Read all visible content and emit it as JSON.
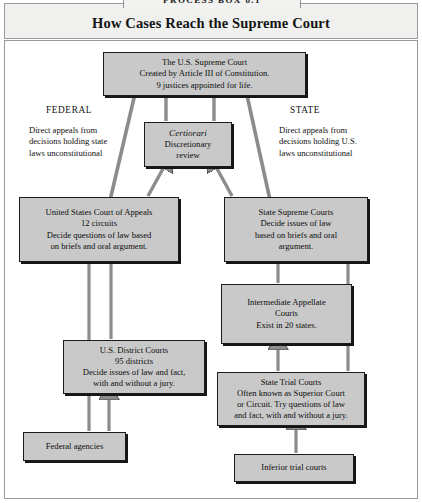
{
  "running_head": "PROCESS BOX 8.1",
  "header": {
    "title": "How Cases Reach the Supreme Court"
  },
  "labels": {
    "federal": "FEDERAL",
    "state": "STATE",
    "federal_note": "Direct appeals from\ndecisions holding state\nlaws unconstitutional",
    "state_note": "Direct appeals from\ndecisions holding U.S.\nlaws unconstitutional"
  },
  "nodes": {
    "supreme_court": {
      "name": "The U.S. Supreme Court",
      "text": "The U.S. Supreme Court\nCreated by Article III of Constitution.\n9 justices appointed for life."
    },
    "certiorari": {
      "title": "Certiorari",
      "text": "Discretionary\nreview"
    },
    "court_of_appeals": {
      "name": "United States Court of Appeals",
      "text": "United States Court of Appeals\n12 circuits\nDecide questions of law based\non briefs and oral argument."
    },
    "state_supreme_courts": {
      "name": "State Supreme Courts",
      "text": "State Supreme Courts\nDecide issues of law\nbased on briefs and oral\nargument."
    },
    "intermediate_appellate": {
      "name": "Intermediate Appellate Courts",
      "text": "Intermediate Appellate\nCourts\nExist in 20 states."
    },
    "district_courts": {
      "name": "U.S. District Courts",
      "text": "U.S. District Courts\n95 districts\nDecide issues of law and fact,\nwith and without a jury."
    },
    "state_trial_courts": {
      "name": "State Trial Courts",
      "text": "State Trial Courts\nOften known as Superior Court\nor Circuit. Try questions of law\nand fact, with and without a jury."
    },
    "federal_agencies": {
      "name": "Federal agencies",
      "text": "Federal agencies"
    },
    "inferior_trial_courts": {
      "name": "Inferior trial courts",
      "text": "Inferior trial courts"
    }
  },
  "colors": {
    "box_fill": "#c9c9c9",
    "box_border": "#1b1b1b",
    "arrow_fill": "#8c8c8c",
    "arrow_stroke": "#5a5a5a",
    "header_band": "#f0f0ee",
    "frame_border": "#9a9a9a",
    "page_background": "#ffffff"
  }
}
